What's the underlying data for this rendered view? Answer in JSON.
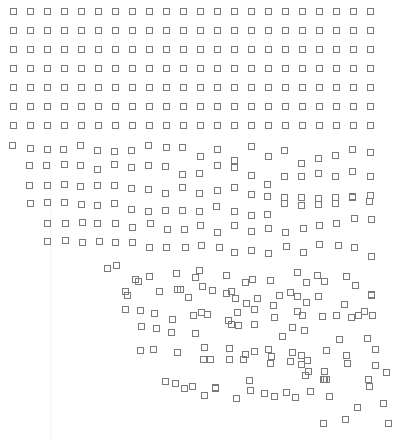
{
  "artwork": {
    "background": "#ffffff",
    "stroke_color": "#7a7a7a",
    "square_size": 5,
    "grid": {
      "columns": 22,
      "ordered_rows": 7,
      "col_x": [
        14,
        31,
        48,
        65,
        82,
        99,
        116,
        133,
        150,
        167,
        184,
        201,
        218,
        235,
        252,
        269,
        286,
        303,
        320,
        337,
        354,
        371
      ],
      "row_y": [
        12,
        31,
        50,
        69,
        88,
        107,
        126
      ]
    },
    "scattered_squares": [
      [
        13,
        146
      ],
      [
        31,
        149
      ],
      [
        48,
        150
      ],
      [
        64,
        150
      ],
      [
        81,
        146
      ],
      [
        98,
        151
      ],
      [
        115,
        152
      ],
      [
        132,
        151
      ],
      [
        149,
        146
      ],
      [
        167,
        148
      ],
      [
        183,
        148
      ],
      [
        201,
        157
      ],
      [
        218,
        150
      ],
      [
        235,
        161
      ],
      [
        252,
        147
      ],
      [
        269,
        157
      ],
      [
        285,
        151
      ],
      [
        302,
        164
      ],
      [
        319,
        159
      ],
      [
        336,
        156
      ],
      [
        353,
        150
      ],
      [
        371,
        153
      ],
      [
        30,
        166
      ],
      [
        47,
        166
      ],
      [
        65,
        165
      ],
      [
        81,
        166
      ],
      [
        98,
        170
      ],
      [
        115,
        165
      ],
      [
        132,
        168
      ],
      [
        149,
        166
      ],
      [
        166,
        167
      ],
      [
        183,
        175
      ],
      [
        200,
        174
      ],
      [
        218,
        166
      ],
      [
        235,
        168
      ],
      [
        252,
        176
      ],
      [
        268,
        185
      ],
      [
        285,
        177
      ],
      [
        302,
        177
      ],
      [
        319,
        174
      ],
      [
        336,
        177
      ],
      [
        353,
        172
      ],
      [
        371,
        177
      ],
      [
        30,
        186
      ],
      [
        48,
        186
      ],
      [
        65,
        185
      ],
      [
        81,
        187
      ],
      [
        98,
        186
      ],
      [
        115,
        186
      ],
      [
        132,
        189
      ],
      [
        149,
        190
      ],
      [
        166,
        194
      ],
      [
        183,
        188
      ],
      [
        200,
        194
      ],
      [
        218,
        191
      ],
      [
        235,
        188
      ],
      [
        252,
        195
      ],
      [
        268,
        197
      ],
      [
        285,
        198
      ],
      [
        302,
        198
      ],
      [
        319,
        199
      ],
      [
        336,
        198
      ],
      [
        353,
        197
      ],
      [
        371,
        196
      ],
      [
        31,
        204
      ],
      [
        48,
        203
      ],
      [
        65,
        203
      ],
      [
        82,
        205
      ],
      [
        98,
        206
      ],
      [
        115,
        204
      ],
      [
        132,
        210
      ],
      [
        149,
        212
      ],
      [
        166,
        211
      ],
      [
        183,
        211
      ],
      [
        200,
        212
      ],
      [
        217,
        207
      ],
      [
        235,
        212
      ],
      [
        252,
        216
      ],
      [
        268,
        215
      ],
      [
        285,
        204
      ],
      [
        302,
        206
      ],
      [
        319,
        205
      ],
      [
        336,
        204
      ],
      [
        353,
        198
      ],
      [
        370,
        202
      ],
      [
        48,
        224
      ],
      [
        66,
        224
      ],
      [
        83,
        223
      ],
      [
        98,
        224
      ],
      [
        116,
        224
      ],
      [
        133,
        228
      ],
      [
        151,
        224
      ],
      [
        168,
        230
      ],
      [
        185,
        230
      ],
      [
        201,
        226
      ],
      [
        218,
        233
      ],
      [
        235,
        226
      ],
      [
        252,
        232
      ],
      [
        269,
        229
      ],
      [
        286,
        233
      ],
      [
        304,
        229
      ],
      [
        320,
        226
      ],
      [
        337,
        224
      ],
      [
        355,
        219
      ],
      [
        372,
        220
      ],
      [
        48,
        242
      ],
      [
        66,
        241
      ],
      [
        83,
        243
      ],
      [
        100,
        242
      ],
      [
        116,
        243
      ],
      [
        133,
        243
      ],
      [
        150,
        248
      ],
      [
        167,
        248
      ],
      [
        186,
        248
      ],
      [
        202,
        246
      ],
      [
        220,
        248
      ],
      [
        235,
        253
      ],
      [
        252,
        251
      ],
      [
        269,
        254
      ],
      [
        287,
        247
      ],
      [
        304,
        253
      ],
      [
        320,
        245
      ],
      [
        339,
        246
      ],
      [
        355,
        248
      ],
      [
        372,
        257
      ],
      [
        108,
        269
      ],
      [
        117,
        266
      ],
      [
        136,
        280
      ],
      [
        139,
        282
      ],
      [
        150,
        277
      ],
      [
        177,
        274
      ],
      [
        196,
        278
      ],
      [
        178,
        290
      ],
      [
        200,
        271
      ],
      [
        227,
        276
      ],
      [
        227,
        294
      ],
      [
        253,
        280
      ],
      [
        246,
        283
      ],
      [
        271,
        281
      ],
      [
        280,
        296
      ],
      [
        298,
        273
      ],
      [
        307,
        283
      ],
      [
        318,
        276
      ],
      [
        325,
        282
      ],
      [
        347,
        277
      ],
      [
        356,
        286
      ],
      [
        372,
        295
      ],
      [
        126,
        292
      ],
      [
        128,
        296
      ],
      [
        160,
        292
      ],
      [
        181,
        290
      ],
      [
        189,
        298
      ],
      [
        203,
        287
      ],
      [
        213,
        291
      ],
      [
        232,
        292
      ],
      [
        236,
        299
      ],
      [
        247,
        304
      ],
      [
        258,
        299
      ],
      [
        274,
        306
      ],
      [
        291,
        293
      ],
      [
        298,
        297
      ],
      [
        307,
        303
      ],
      [
        319,
        297
      ],
      [
        345,
        305
      ],
      [
        372,
        296
      ],
      [
        126,
        310
      ],
      [
        141,
        311
      ],
      [
        155,
        314
      ],
      [
        173,
        320
      ],
      [
        194,
        316
      ],
      [
        202,
        313
      ],
      [
        208,
        315
      ],
      [
        229,
        321
      ],
      [
        238,
        313
      ],
      [
        255,
        310
      ],
      [
        275,
        318
      ],
      [
        298,
        312
      ],
      [
        303,
        316
      ],
      [
        323,
        317
      ],
      [
        337,
        316
      ],
      [
        352,
        318
      ],
      [
        359,
        316
      ],
      [
        365,
        312
      ],
      [
        373,
        316
      ],
      [
        142,
        327
      ],
      [
        157,
        329
      ],
      [
        172,
        333
      ],
      [
        196,
        334
      ],
      [
        232,
        325
      ],
      [
        239,
        326
      ],
      [
        255,
        325
      ],
      [
        293,
        328
      ],
      [
        305,
        331
      ],
      [
        283,
        337
      ],
      [
        340,
        340
      ],
      [
        368,
        339
      ],
      [
        141,
        351
      ],
      [
        154,
        350
      ],
      [
        178,
        353
      ],
      [
        205,
        348
      ],
      [
        211,
        360
      ],
      [
        230,
        349
      ],
      [
        246,
        355
      ],
      [
        255,
        352
      ],
      [
        269,
        350
      ],
      [
        272,
        357
      ],
      [
        293,
        353
      ],
      [
        302,
        365
      ],
      [
        308,
        361
      ],
      [
        327,
        351
      ],
      [
        347,
        356
      ],
      [
        376,
        350
      ],
      [
        204,
        360
      ],
      [
        230,
        360
      ],
      [
        244,
        360
      ],
      [
        271,
        364
      ],
      [
        291,
        362
      ],
      [
        302,
        356
      ],
      [
        309,
        372
      ],
      [
        306,
        376
      ],
      [
        325,
        372
      ],
      [
        348,
        364
      ],
      [
        376,
        366
      ],
      [
        387,
        373
      ],
      [
        166,
        382
      ],
      [
        176,
        384
      ],
      [
        185,
        389
      ],
      [
        193,
        387
      ],
      [
        205,
        396
      ],
      [
        216,
        389
      ],
      [
        237,
        399
      ],
      [
        250,
        381
      ],
      [
        251,
        391
      ],
      [
        265,
        394
      ],
      [
        275,
        397
      ],
      [
        287,
        393
      ],
      [
        296,
        398
      ],
      [
        311,
        392
      ],
      [
        324,
        380
      ],
      [
        327,
        380
      ],
      [
        330,
        397
      ],
      [
        369,
        380
      ],
      [
        370,
        387
      ],
      [
        216,
        388
      ],
      [
        325,
        380
      ],
      [
        358,
        408
      ],
      [
        384,
        404
      ],
      [
        324,
        424
      ],
      [
        346,
        420
      ],
      [
        389,
        424
      ]
    ]
  }
}
